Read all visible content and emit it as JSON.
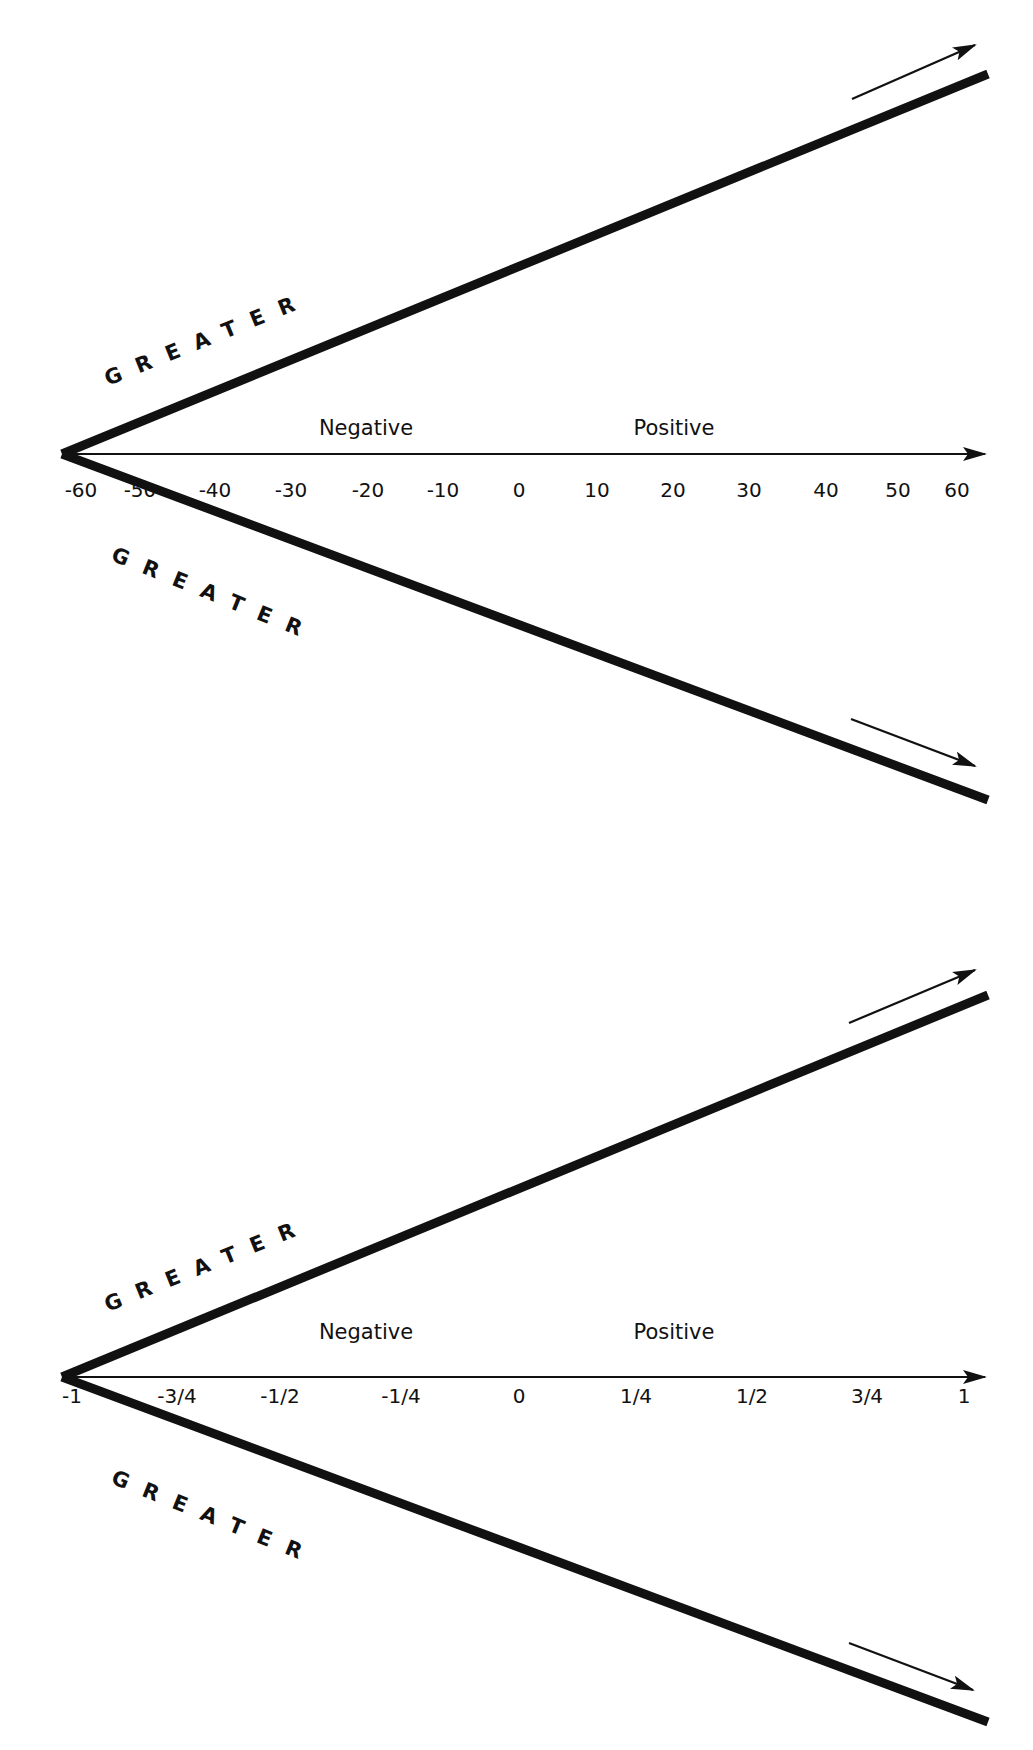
{
  "diagrams": [
    {
      "id": "integer-scale",
      "upper_label": "GREATER",
      "lower_label": "GREATER",
      "negative_label": "Negative",
      "positive_label": "Positive",
      "ticks": [
        "-60",
        "-50",
        "-40",
        "-30",
        "-20",
        "-10",
        "0",
        "10",
        "20",
        "30",
        "40",
        "50",
        "60"
      ]
    },
    {
      "id": "fraction-scale",
      "upper_label": "GREATER",
      "lower_label": "GREATER",
      "negative_label": "Negative",
      "positive_label": "Positive",
      "ticks": [
        "-1",
        "-3/4",
        "-1/2",
        "-1/4",
        "0",
        "1/4",
        "1/2",
        "3/4",
        "1"
      ]
    }
  ],
  "colors": {
    "ink": "#111111",
    "background": "#ffffff"
  }
}
